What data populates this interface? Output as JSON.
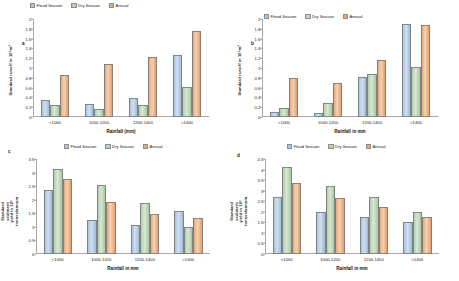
{
  "figure": {
    "panels": [
      "a",
      "b",
      "c",
      "d"
    ],
    "series_names": [
      "Flood Season",
      "Dry Season",
      "Annual"
    ],
    "colors": {
      "flood_season": "#a9c4e0",
      "dry_season": "#b9d3b3",
      "annual": "#eaa87a"
    },
    "categories": [
      "<1000",
      "1000-1200",
      "1200-1400",
      ">1400"
    ],
    "xlabel_runoff": "Rainfall (mm)",
    "xlabel_sediment": "Rainfall in mm"
  },
  "chart_data": [
    {
      "type": "bar",
      "panel": "a",
      "title": "",
      "xlabel": "Rainfall (mm)",
      "ylabel": "Standard runoff in 10⁶m³",
      "categories": [
        "<1000",
        "1000-1200",
        "1200-1400",
        ">1400"
      ],
      "series": [
        {
          "name": "Flood Season",
          "values": [
            0.35,
            0.27,
            0.39,
            1.27
          ]
        },
        {
          "name": "Dry Season",
          "values": [
            0.24,
            0.17,
            0.24,
            0.62
          ]
        },
        {
          "name": "Annual",
          "values": [
            0.85,
            1.08,
            1.23,
            1.75
          ]
        }
      ],
      "ylim": [
        0,
        2
      ],
      "yticks": [
        0,
        0.2,
        0.4,
        0.6,
        0.8,
        1,
        1.2,
        1.4,
        1.6,
        1.8,
        2
      ],
      "ytick_labels": [
        "0",
        "0.2",
        "0.4",
        "0.6",
        "0.8",
        "1",
        "1.2",
        "1.4",
        "1.6",
        "1.8",
        "2"
      ],
      "grid": false,
      "legend": "top"
    },
    {
      "type": "bar",
      "panel": "b",
      "title": "",
      "xlabel": "Rainfall in mm",
      "ylabel": "Standard runoff in 10⁶m³",
      "categories": [
        "<1000",
        "1000-1200",
        "1200-1400",
        ">1400"
      ],
      "series": [
        {
          "name": "Flood Season",
          "values": [
            0.1,
            0.09,
            0.81,
            1.89
          ]
        },
        {
          "name": "Dry Season",
          "values": [
            0.18,
            0.29,
            0.87,
            1.02
          ]
        },
        {
          "name": "Annual",
          "values": [
            0.79,
            0.7,
            1.17,
            1.87
          ]
        }
      ],
      "ylim": [
        0,
        2
      ],
      "yticks": [
        0,
        0.2,
        0.4,
        0.6,
        0.8,
        1,
        1.2,
        1.4,
        1.6,
        1.8,
        2
      ],
      "ytick_labels": [
        "0",
        "0.2",
        "0.4",
        "0.6",
        "0.8",
        "1",
        "1.2",
        "1.4",
        "1.6",
        "1.8",
        "2"
      ],
      "grid": false,
      "legend": "top"
    },
    {
      "type": "bar",
      "panel": "c",
      "title": "",
      "xlabel": "Rainfall in mm",
      "ylabel": "Standard sediment yield in 10⁶ tonnes/annum",
      "categories": [
        "<1000",
        "1000-1200",
        "1200-1400",
        ">1400"
      ],
      "series": [
        {
          "name": "Flood Season",
          "values": [
            2.37,
            1.26,
            1.06,
            1.6
          ]
        },
        {
          "name": "Dry Season",
          "values": [
            3.12,
            2.55,
            1.89,
            1.01
          ]
        },
        {
          "name": "Annual",
          "values": [
            2.77,
            1.9,
            1.47,
            1.31
          ]
        }
      ],
      "ylim": [
        0,
        3.5
      ],
      "yticks": [
        0,
        0.5,
        1,
        1.5,
        2,
        2.5,
        3,
        3.5
      ],
      "ytick_labels": [
        "0",
        "0.5",
        "1",
        "1.5",
        "2",
        "2.5",
        "3",
        "3.5"
      ],
      "grid": false,
      "legend": "top-right"
    },
    {
      "type": "bar",
      "panel": "d",
      "title": "",
      "xlabel": "Rainfall in mm",
      "ylabel": "Standard sediment yield in 10⁶ tonnes/annum",
      "categories": [
        "<1000",
        "1000-1200",
        "1200-1400",
        ">1400"
      ],
      "series": [
        {
          "name": "Flood Season",
          "values": [
            2.69,
            2.01,
            1.74,
            1.54
          ]
        },
        {
          "name": "Dry Season",
          "values": [
            4.13,
            3.22,
            2.68,
            1.98
          ]
        },
        {
          "name": "Annual",
          "values": [
            3.38,
            2.65,
            2.21,
            1.76
          ]
        }
      ],
      "ylim": [
        0,
        4.5
      ],
      "yticks": [
        0,
        0.5,
        1,
        1.5,
        2,
        2.5,
        3,
        3.5,
        4,
        4.5
      ],
      "ytick_labels": [
        "0",
        "0.5",
        "1",
        "1.5",
        "2",
        "2.5",
        "3",
        "3.5",
        "4",
        "4.5"
      ],
      "grid": false,
      "legend": "top-right"
    }
  ]
}
